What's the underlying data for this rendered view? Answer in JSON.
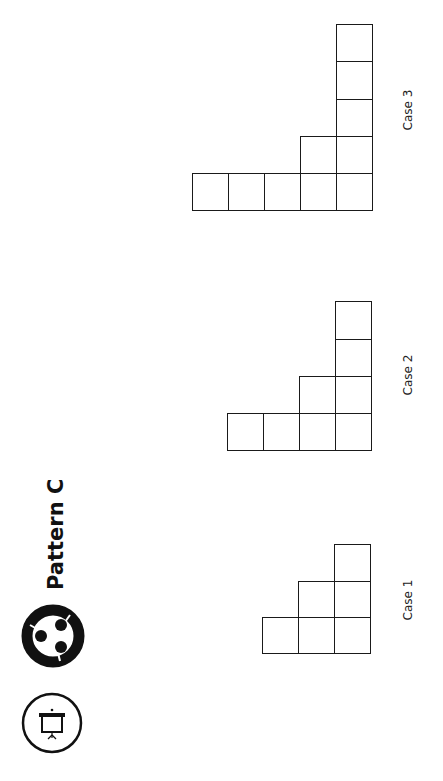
{
  "header": {
    "title": "Pattern C",
    "icons": [
      "projector-icon",
      "team-collaboration-icon"
    ]
  },
  "cases": [
    {
      "label": "Case 1",
      "squares": 6,
      "base_columns": 3,
      "tallest_column": 3
    },
    {
      "label": "Case 2",
      "squares": 10,
      "base_columns": 4,
      "tallest_column": 4
    },
    {
      "label": "Case 3",
      "squares": 15,
      "base_columns": 5,
      "tallest_column": 5
    }
  ],
  "colors": {
    "line": "#1a1a1a",
    "background": "#ffffff"
  }
}
